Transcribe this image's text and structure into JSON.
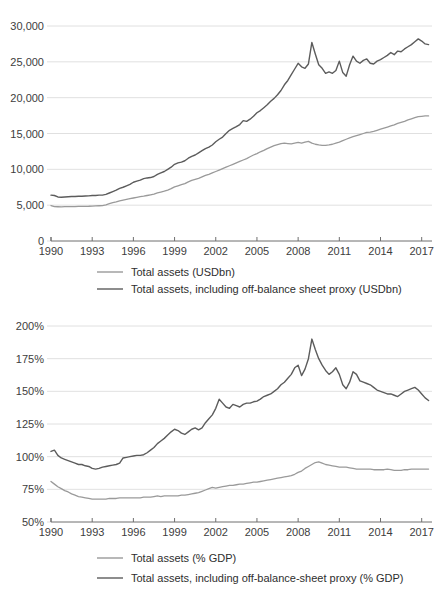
{
  "figures": [
    {
      "id": "total-assets-usdbn",
      "chart_data": {
        "type": "line",
        "title": "",
        "subtitle": "",
        "xlabel": "",
        "ylabel": "",
        "grid": true,
        "legend_position": "bottom",
        "xlim": [
          1990,
          2017.75
        ],
        "ylim": [
          0,
          30000
        ],
        "xticks": [
          1990,
          1993,
          1996,
          1999,
          2002,
          2005,
          2008,
          2011,
          2014,
          2017
        ],
        "xticklabels": [
          "1990",
          "1993",
          "1996",
          "1999",
          "2002",
          "2005",
          "2008",
          "2011",
          "2014",
          "2017"
        ],
        "yticks": [
          0,
          5000,
          10000,
          15000,
          20000,
          25000,
          30000
        ],
        "yticklabels": [
          "0",
          "5,000",
          "10,000",
          "15,000",
          "20,000",
          "25,000",
          "30,000"
        ],
        "x": [
          1990.0,
          1990.25,
          1990.5,
          1990.75,
          1991.0,
          1991.25,
          1991.5,
          1991.75,
          1992.0,
          1992.25,
          1992.5,
          1992.75,
          1993.0,
          1993.25,
          1993.5,
          1993.75,
          1994.0,
          1994.25,
          1994.5,
          1994.75,
          1995.0,
          1995.25,
          1995.5,
          1995.75,
          1996.0,
          1996.25,
          1996.5,
          1996.75,
          1997.0,
          1997.25,
          1997.5,
          1997.75,
          1998.0,
          1998.25,
          1998.5,
          1998.75,
          1999.0,
          1999.25,
          1999.5,
          1999.75,
          2000.0,
          2000.25,
          2000.5,
          2000.75,
          2001.0,
          2001.25,
          2001.5,
          2001.75,
          2002.0,
          2002.25,
          2002.5,
          2002.75,
          2003.0,
          2003.25,
          2003.5,
          2003.75,
          2004.0,
          2004.25,
          2004.5,
          2004.75,
          2005.0,
          2005.25,
          2005.5,
          2005.75,
          2006.0,
          2006.25,
          2006.5,
          2006.75,
          2007.0,
          2007.25,
          2007.5,
          2007.75,
          2008.0,
          2008.25,
          2008.5,
          2008.75,
          2009.0,
          2009.25,
          2009.5,
          2009.75,
          2010.0,
          2010.25,
          2010.5,
          2010.75,
          2011.0,
          2011.25,
          2011.5,
          2011.75,
          2012.0,
          2012.25,
          2012.5,
          2012.75,
          2013.0,
          2013.25,
          2013.5,
          2013.75,
          2014.0,
          2014.25,
          2014.5,
          2014.75,
          2015.0,
          2015.25,
          2015.5,
          2015.75,
          2016.0,
          2016.25,
          2016.5,
          2016.75,
          2017.0,
          2017.25,
          2017.5
        ],
        "series": [
          {
            "name": "Total assets (USDbn)",
            "color": "#9a9a9a",
            "width": 1.3,
            "values": [
              4950,
              4800,
              4780,
              4760,
              4790,
              4800,
              4810,
              4800,
              4820,
              4830,
              4840,
              4850,
              4880,
              4900,
              4920,
              4950,
              5050,
              5200,
              5350,
              5450,
              5600,
              5700,
              5800,
              5900,
              6000,
              6100,
              6180,
              6250,
              6350,
              6450,
              6550,
              6700,
              6820,
              6950,
              7100,
              7300,
              7550,
              7700,
              7850,
              8000,
              8250,
              8450,
              8600,
              8750,
              8950,
              9150,
              9300,
              9500,
              9700,
              9900,
              10100,
              10300,
              10500,
              10700,
              10900,
              11100,
              11300,
              11500,
              11750,
              12000,
              12200,
              12450,
              12650,
              12900,
              13100,
              13300,
              13450,
              13600,
              13650,
              13600,
              13550,
              13650,
              13750,
              13650,
              13800,
              13900,
              13650,
              13500,
              13400,
              13350,
              13350,
              13400,
              13500,
              13650,
              13800,
              14000,
              14200,
              14400,
              14550,
              14700,
              14850,
              15000,
              15150,
              15200,
              15300,
              15450,
              15600,
              15750,
              15900,
              16050,
              16200,
              16400,
              16550,
              16700,
              16900,
              17050,
              17200,
              17350,
              17400,
              17450,
              17450
            ]
          },
          {
            "name": "Total assets, including off-balance sheet proxy (USDbn)",
            "color": "#5c5c5c",
            "width": 1.4,
            "values": [
              6400,
              6350,
              6150,
              6100,
              6150,
              6180,
              6200,
              6200,
              6250,
              6250,
              6280,
              6300,
              6350,
              6350,
              6400,
              6400,
              6500,
              6700,
              6900,
              7100,
              7350,
              7500,
              7700,
              7900,
              8200,
              8350,
              8500,
              8700,
              8800,
              8850,
              9000,
              9300,
              9500,
              9700,
              10000,
              10300,
              10700,
              10900,
              11000,
              11200,
              11550,
              11800,
              12000,
              12300,
              12600,
              12900,
              13100,
              13400,
              13850,
              14200,
              14500,
              15000,
              15450,
              15700,
              15950,
              16250,
              16800,
              16700,
              17000,
              17400,
              17900,
              18200,
              18600,
              19000,
              19500,
              19900,
              20400,
              21000,
              21800,
              22400,
              23200,
              24000,
              24800,
              24300,
              24100,
              24700,
              27700,
              26100,
              24600,
              24100,
              23400,
              23600,
              23400,
              23800,
              25100,
              23500,
              23000,
              24600,
              25800,
              25100,
              24800,
              25200,
              25400,
              24800,
              24700,
              25100,
              25300,
              25600,
              25900,
              26300,
              26000,
              26500,
              26400,
              26800,
              27100,
              27400,
              27800,
              28200,
              27900,
              27500,
              27400
            ]
          }
        ],
        "legend": [
          {
            "label": "Total assets (USDbn)",
            "color": "#9a9a9a"
          },
          {
            "label": "Total assets, including off-balance sheet proxy (USDbn)",
            "color": "#5c5c5c"
          }
        ]
      }
    },
    {
      "id": "total-assets-pct-gdp",
      "chart_data": {
        "type": "line",
        "title": "",
        "subtitle": "",
        "xlabel": "",
        "ylabel": "",
        "grid": true,
        "legend_position": "bottom",
        "xlim": [
          1990,
          2017.75
        ],
        "ylim": [
          50,
          200
        ],
        "xticks": [
          1990,
          1993,
          1996,
          1999,
          2002,
          2005,
          2008,
          2011,
          2014,
          2017
        ],
        "xticklabels": [
          "1990",
          "1993",
          "1996",
          "1999",
          "2002",
          "2005",
          "2008",
          "2011",
          "2014",
          "2017"
        ],
        "yticks": [
          50,
          75,
          100,
          125,
          150,
          175,
          200
        ],
        "yticklabels": [
          "50%",
          "75%",
          "100%",
          "125%",
          "150%",
          "175%",
          "200%"
        ],
        "x": [
          1990.0,
          1990.25,
          1990.5,
          1990.75,
          1991.0,
          1991.25,
          1991.5,
          1991.75,
          1992.0,
          1992.25,
          1992.5,
          1992.75,
          1993.0,
          1993.25,
          1993.5,
          1993.75,
          1994.0,
          1994.25,
          1994.5,
          1994.75,
          1995.0,
          1995.25,
          1995.5,
          1995.75,
          1996.0,
          1996.25,
          1996.5,
          1996.75,
          1997.0,
          1997.25,
          1997.5,
          1997.75,
          1998.0,
          1998.25,
          1998.5,
          1998.75,
          1999.0,
          1999.25,
          1999.5,
          1999.75,
          2000.0,
          2000.25,
          2000.5,
          2000.75,
          2001.0,
          2001.25,
          2001.5,
          2001.75,
          2002.0,
          2002.25,
          2002.5,
          2002.75,
          2003.0,
          2003.25,
          2003.5,
          2003.75,
          2004.0,
          2004.25,
          2004.5,
          2004.75,
          2005.0,
          2005.25,
          2005.5,
          2005.75,
          2006.0,
          2006.25,
          2006.5,
          2006.75,
          2007.0,
          2007.25,
          2007.5,
          2007.75,
          2008.0,
          2008.25,
          2008.5,
          2008.75,
          2009.0,
          2009.25,
          2009.5,
          2009.75,
          2010.0,
          2010.25,
          2010.5,
          2010.75,
          2011.0,
          2011.25,
          2011.5,
          2011.75,
          2012.0,
          2012.25,
          2012.5,
          2012.75,
          2013.0,
          2013.25,
          2013.5,
          2013.75,
          2014.0,
          2014.25,
          2014.5,
          2014.75,
          2015.0,
          2015.25,
          2015.5,
          2015.75,
          2016.0,
          2016.25,
          2016.5,
          2016.75,
          2017.0,
          2017.25,
          2017.5
        ],
        "series": [
          {
            "name": "Total assets (% GDP)",
            "color": "#9a9a9a",
            "width": 1.3,
            "values": [
              81,
              79,
              77,
              75.5,
              74,
              73,
              71.5,
              70.5,
              69.5,
              69,
              68.5,
              68,
              67.5,
              67.5,
              67.5,
              67.5,
              67.5,
              68,
              68,
              68,
              68.5,
              68.5,
              68.5,
              68.5,
              68.5,
              68.5,
              68.5,
              69,
              69,
              69,
              69.5,
              70,
              69.5,
              70,
              70,
              70,
              70,
              70,
              70.5,
              70.5,
              71,
              71.5,
              72,
              72.5,
              73.5,
              74.5,
              75.5,
              76.5,
              76,
              76.5,
              77,
              77.5,
              78,
              78,
              78.5,
              79,
              79,
              79.5,
              80,
              80.5,
              80.5,
              81,
              81.5,
              82,
              82.5,
              83,
              83.5,
              84,
              84.5,
              85,
              85.5,
              86.5,
              88,
              89,
              91,
              92.5,
              94,
              95.5,
              96,
              95,
              94,
              93.5,
              93,
              92.5,
              92,
              92,
              92,
              91.5,
              91,
              90.5,
              90.5,
              90.5,
              90.5,
              90.5,
              90,
              90,
              90,
              90,
              90.5,
              90,
              89.5,
              89.5,
              89.5,
              90,
              90,
              90.5,
              90.5,
              90.5,
              90.5,
              90.5,
              90.5
            ]
          },
          {
            "name": "Total assets, including off-balance-sheet proxy (% GDP)",
            "color": "#5c5c5c",
            "width": 1.4,
            "values": [
              104,
              105,
              101,
              99,
              98,
              97,
              96,
              95,
              94,
              94,
              93,
              92.5,
              91,
              90.5,
              91,
              92,
              92.5,
              93,
              93.5,
              94,
              95,
              99,
              99.5,
              100,
              100.5,
              101,
              101,
              101.5,
              103,
              105,
              107,
              110,
              112,
              114,
              116.5,
              119,
              121,
              120,
              118,
              117,
              119,
              121,
              122,
              120.5,
              122,
              126,
              129,
              132,
              137,
              144,
              141,
              138,
              137,
              140,
              139,
              138,
              140,
              141,
              141,
              142,
              142.5,
              144,
              146,
              147,
              148,
              150,
              152,
              155,
              157,
              160,
              163,
              168,
              170,
              162,
              167,
              175,
              190,
              182,
              175,
              170,
              166,
              163,
              165,
              168,
              163,
              155,
              152,
              157,
              165,
              163,
              158,
              157,
              156,
              155,
              153,
              151,
              150,
              149,
              148,
              148,
              147,
              146,
              148,
              150,
              151,
              152,
              153,
              151,
              148,
              145,
              143,
              142
            ]
          }
        ],
        "legend": [
          {
            "label": "Total assets (% GDP)",
            "color": "#9a9a9a"
          },
          {
            "label": "Total assets, including off-balance-sheet proxy (% GDP)",
            "color": "#5c5c5c"
          }
        ]
      }
    }
  ]
}
